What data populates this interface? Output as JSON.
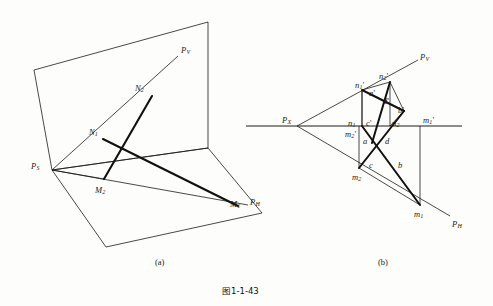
{
  "figure": {
    "caption": "图1-1-43",
    "caption_x": 222,
    "caption_y": 287,
    "sub_captions": [
      {
        "text": "(a)",
        "x": 155,
        "y": 258
      },
      {
        "text": "(b)",
        "x": 378,
        "y": 258
      }
    ]
  },
  "diagram_a": {
    "name": "pictorial-view",
    "labels": [
      {
        "id": "PV",
        "base": "P",
        "sub": "V",
        "prime": "",
        "x": 181,
        "y": 46
      },
      {
        "id": "N2",
        "base": "N",
        "sub": "2",
        "prime": "",
        "x": 135,
        "y": 84
      },
      {
        "id": "N1",
        "base": "N",
        "sub": "1",
        "prime": "",
        "x": 89,
        "y": 128
      },
      {
        "id": "PS",
        "base": "P",
        "sub": "S",
        "prime": "",
        "x": 31,
        "y": 162
      },
      {
        "id": "M2",
        "base": "M",
        "sub": "2",
        "prime": "",
        "x": 95,
        "y": 186
      },
      {
        "id": "M1",
        "base": "M",
        "sub": "1",
        "prime": "",
        "x": 230,
        "y": 200
      },
      {
        "id": "PH",
        "base": "P",
        "sub": "H",
        "prime": "",
        "x": 250,
        "y": 198
      }
    ],
    "geometry": {
      "vertical_plane": "34,70 208,22 208,148 52,170",
      "horizontal_plane": "52,170 208,148 262,213 106,247",
      "ps_vertex": [
        52,
        170
      ],
      "pv_end": [
        178,
        56
      ],
      "ph_end": [
        248,
        205
      ],
      "n2_point": [
        152,
        96
      ],
      "n1_point": [
        103,
        139
      ],
      "m2_point": [
        104,
        179
      ],
      "m1_point": [
        238,
        206
      ],
      "segments_thin": [
        "52,170 178,56",
        "52,170 248,205",
        "52,170 104,179"
      ],
      "segments_thick": [
        "152,96 104,179",
        "103,139 238,206"
      ]
    }
  },
  "diagram_b": {
    "name": "orthographic-projection",
    "labels": [
      {
        "id": "PV",
        "base": "P",
        "sub": "V",
        "prime": "",
        "x": 420,
        "y": 53
      },
      {
        "id": "PH",
        "base": "P",
        "sub": "H",
        "prime": "",
        "x": 452,
        "y": 220
      },
      {
        "id": "PX",
        "base": "P",
        "sub": "X",
        "prime": "",
        "x": 282,
        "y": 116
      },
      {
        "id": "n1p",
        "base": "n",
        "sub": "1",
        "prime": "'",
        "x": 355,
        "y": 81
      },
      {
        "id": "n2p",
        "base": "n",
        "sub": "2",
        "prime": "'",
        "x": 379,
        "y": 72
      },
      {
        "id": "ap",
        "base": "a",
        "sub": "",
        "prime": "'",
        "x": 369,
        "y": 89
      },
      {
        "id": "dp",
        "base": "d",
        "sub": "",
        "prime": "'",
        "x": 383,
        "y": 97
      },
      {
        "id": "bp",
        "base": "b",
        "sub": "",
        "prime": "'",
        "x": 398,
        "y": 106
      },
      {
        "id": "n1",
        "base": "n",
        "sub": "1",
        "prime": "",
        "x": 348,
        "y": 119
      },
      {
        "id": "cp",
        "base": "c",
        "sub": "",
        "prime": "'",
        "x": 366,
        "y": 119
      },
      {
        "id": "n2",
        "base": "n",
        "sub": "2",
        "prime": "",
        "x": 392,
        "y": 119
      },
      {
        "id": "m1p",
        "base": "m",
        "sub": "1",
        "prime": "'",
        "x": 423,
        "y": 116
      },
      {
        "id": "m2p",
        "base": "m",
        "sub": "2",
        "prime": "'",
        "x": 345,
        "y": 130
      },
      {
        "id": "a",
        "base": "a",
        "sub": "",
        "prime": "",
        "x": 363,
        "y": 137
      },
      {
        "id": "d",
        "base": "d",
        "sub": "",
        "prime": "",
        "x": 385,
        "y": 137
      },
      {
        "id": "c",
        "base": "c",
        "sub": "",
        "prime": "",
        "x": 369,
        "y": 161
      },
      {
        "id": "b",
        "base": "b",
        "sub": "",
        "prime": "",
        "x": 398,
        "y": 161
      },
      {
        "id": "m2",
        "base": "m",
        "sub": "2",
        "prime": "",
        "x": 352,
        "y": 173
      },
      {
        "id": "m1",
        "base": "m",
        "sub": "1",
        "prime": "",
        "x": 414,
        "y": 210
      }
    ],
    "geometry": {
      "ground_line": "246,126 462,126",
      "px_vertex": [
        297,
        126
      ],
      "pv_trace": "297,126 418,60",
      "ph_trace": "297,126 450,216",
      "points": {
        "n1p": [
          362,
          90
        ],
        "n2p": [
          390,
          82
        ],
        "n1": [
          362,
          126
        ],
        "n2": [
          390,
          126
        ],
        "m2p": [
          359,
          126
        ],
        "m1p": [
          420,
          126
        ],
        "m2": [
          359,
          168
        ],
        "m1": [
          420,
          205
        ],
        "ap": [
          377,
          98
        ],
        "dp": [
          390,
          104
        ],
        "bp": [
          404,
          111
        ],
        "cp": [
          377,
          126
        ],
        "a": [
          372,
          140
        ],
        "d": [
          392,
          140
        ],
        "c": [
          377,
          156
        ],
        "b": [
          404,
          156
        ]
      },
      "verticals": [
        "362,90 362,126",
        "390,82 390,126",
        "359,126 359,168",
        "420,126 420,205"
      ],
      "thin_segments": [
        "362,90 390,82",
        "390,82 404,111",
        "404,111 377,126",
        "362,90 377,126",
        "359,168 420,205",
        "377,156 359,168",
        "404,156 420,205"
      ],
      "thick_segments": [
        "362,90 404,111",
        "390,82 377,126",
        "359,168 404,111",
        "377,156 420,205",
        "362,126 404,156",
        "390,126 377,156"
      ]
    }
  },
  "style": {
    "line_color": "#1a1a1a",
    "thin_width": 0.8,
    "thick_width": 2.0,
    "background": "#fdfdfb"
  }
}
